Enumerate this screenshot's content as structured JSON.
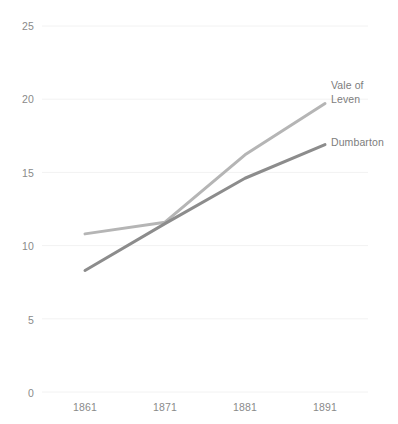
{
  "chart_data": {
    "type": "line",
    "title": "",
    "subtitle": "",
    "xlabel": "",
    "ylabel": "",
    "categories": [
      "1861",
      "1871",
      "1881",
      "1891"
    ],
    "x": [
      1861,
      1871,
      1881,
      1891
    ],
    "ylim": [
      0,
      25
    ],
    "yticks": [
      0,
      5,
      10,
      15,
      20,
      25
    ],
    "ytick_labels": [
      "0",
      "5",
      "10",
      "15",
      "20",
      "25"
    ],
    "xtick_labels": [
      "1861",
      "1871",
      "1881",
      "1891"
    ],
    "grid": true,
    "grid_axis": "y",
    "legend_position": "right-inline-end-of-line",
    "series": [
      {
        "name": "Vale of\nLeven",
        "name_flat": "Vale of Leven",
        "values": [
          10.8,
          11.6,
          16.2,
          19.7
        ],
        "color": "#b5b5b5"
      },
      {
        "name": "Dumbarton",
        "name_flat": "Dumbarton",
        "values": [
          8.3,
          11.5,
          14.6,
          16.9
        ],
        "color": "#8c8c8c"
      }
    ],
    "annotations": []
  },
  "axis": {
    "y_labels": [
      {
        "text": "25",
        "top": 21
      },
      {
        "text": "20",
        "top": 94
      },
      {
        "text": "15",
        "top": 168
      },
      {
        "text": "10",
        "top": 241
      },
      {
        "text": "5",
        "top": 315
      },
      {
        "text": "0",
        "top": 388
      }
    ],
    "x_labels": [
      {
        "text": "1861",
        "left": 62
      },
      {
        "text": "1871",
        "left": 142
      },
      {
        "text": "1881",
        "left": 222
      },
      {
        "text": "1891",
        "left": 302
      }
    ]
  },
  "legend": {
    "items": [
      {
        "label": "Vale of\nLeven",
        "left": 331,
        "top": 79,
        "color": "#7d7d7d"
      },
      {
        "label": "Dumbarton",
        "left": 331,
        "top": 136,
        "color": "#7d7d7d"
      }
    ]
  },
  "colors": {
    "background": "#ffffff",
    "gridline": "#f2f2f2",
    "tick_text": "#8a8a8a",
    "series_vale_of_leven": "#b5b5b5",
    "series_dumbarton": "#8c8c8c"
  }
}
